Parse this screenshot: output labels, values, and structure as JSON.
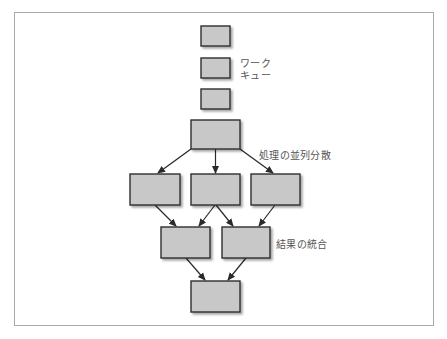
{
  "diagram": {
    "type": "flow",
    "colors": {
      "box_fill": "#c8c8c8",
      "box_stroke": "#2e2e2e",
      "arrow": "#2a2a2a",
      "frame": "#a9a9a9",
      "label_text": "#555555"
    },
    "labels": {
      "work_queue_line1": "ワーク",
      "work_queue_line2": "キュー",
      "parallel_distribution": "処理の並列分散",
      "merge_results": "結果の統合"
    },
    "nodes": [
      {
        "id": "queue-1",
        "x": 201,
        "y": 26,
        "w": 29,
        "h": 20
      },
      {
        "id": "queue-2",
        "x": 201,
        "y": 58,
        "w": 29,
        "h": 20
      },
      {
        "id": "queue-3",
        "x": 201,
        "y": 89,
        "w": 29,
        "h": 20
      },
      {
        "id": "dispatcher",
        "x": 191,
        "y": 120,
        "w": 49,
        "h": 29
      },
      {
        "id": "worker-1",
        "x": 130,
        "y": 174,
        "w": 50,
        "h": 31
      },
      {
        "id": "worker-2",
        "x": 191,
        "y": 174,
        "w": 49,
        "h": 31
      },
      {
        "id": "worker-3",
        "x": 251,
        "y": 174,
        "w": 49,
        "h": 31
      },
      {
        "id": "merger-1",
        "x": 161,
        "y": 227,
        "w": 49,
        "h": 31
      },
      {
        "id": "merger-2",
        "x": 222,
        "y": 227,
        "w": 48,
        "h": 31
      },
      {
        "id": "result",
        "x": 191,
        "y": 281,
        "w": 49,
        "h": 31
      }
    ],
    "edges": [
      {
        "from": "dispatcher",
        "to": "worker-1"
      },
      {
        "from": "dispatcher",
        "to": "worker-2"
      },
      {
        "from": "dispatcher",
        "to": "worker-3"
      },
      {
        "from": "worker-1",
        "to": "merger-1"
      },
      {
        "from": "worker-2",
        "to": "merger-1"
      },
      {
        "from": "worker-2",
        "to": "merger-2"
      },
      {
        "from": "worker-3",
        "to": "merger-2"
      },
      {
        "from": "merger-1",
        "to": "result"
      },
      {
        "from": "merger-2",
        "to": "result"
      }
    ]
  }
}
